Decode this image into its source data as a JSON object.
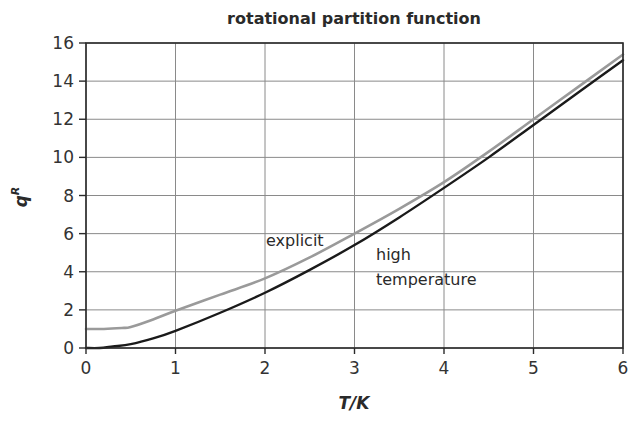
{
  "chart_data": {
    "type": "line",
    "title": "rotational partition function",
    "xlabel": "T/K",
    "ylabel": "q^R",
    "ylabel_main": "q",
    "ylabel_sup": "R",
    "xlim": [
      0,
      6
    ],
    "ylim": [
      0,
      16
    ],
    "xticks": [
      0,
      1,
      2,
      3,
      4,
      5,
      6
    ],
    "yticks": [
      0,
      2,
      4,
      6,
      8,
      10,
      12,
      14,
      16
    ],
    "grid": true,
    "legend": "none (inline annotations)",
    "series": [
      {
        "name": "explicit",
        "color": "#9a9a9a",
        "x": [
          0,
          0.2,
          0.4,
          0.5,
          0.75,
          1.0,
          1.5,
          2.0,
          2.5,
          3.0,
          3.5,
          4.0,
          4.5,
          5.0,
          5.5,
          6.0
        ],
        "values": [
          1.0,
          1.0,
          1.05,
          1.1,
          1.5,
          1.95,
          2.8,
          3.65,
          4.75,
          6.0,
          7.3,
          8.7,
          10.3,
          12.0,
          13.7,
          15.4
        ]
      },
      {
        "name": "high temperature",
        "color": "#1a1a1a",
        "x": [
          0,
          0.15,
          0.3,
          0.5,
          0.75,
          1.0,
          1.5,
          2.0,
          2.5,
          3.0,
          3.5,
          4.0,
          4.5,
          5.0,
          5.5,
          6.0
        ],
        "values": [
          0,
          0.0,
          0.08,
          0.2,
          0.5,
          0.9,
          1.85,
          2.9,
          4.1,
          5.4,
          6.85,
          8.4,
          10.0,
          11.7,
          13.4,
          15.1
        ]
      }
    ],
    "annotations": [
      {
        "text": "explicit",
        "x": 2.0,
        "y": 5.6
      },
      {
        "text": "high",
        "x": 3.25,
        "y": 4.8
      },
      {
        "text": "temperature",
        "x": 3.25,
        "y": 3.3
      }
    ]
  },
  "labels": {
    "title": "rotational partition function",
    "xlabel": "T/K",
    "ylabel_main": "q",
    "ylabel_sup": "R",
    "annot_explicit": "explicit",
    "annot_high_1": "high",
    "annot_high_2": "temperature"
  }
}
